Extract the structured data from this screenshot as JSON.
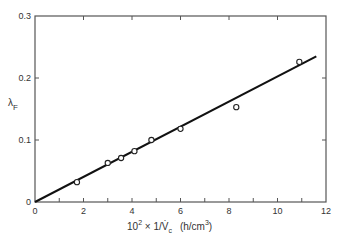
{
  "chart_data": {
    "type": "scatter",
    "title": "",
    "xlabel": "10² × 1/V̇c (h/cm³)",
    "xlabel_parts": {
      "main": "10",
      "sup": "2",
      "rest": " × 1/V̇",
      "sub": "c",
      "unit": "(h/cm",
      "unit_sup": "3",
      "unit_end": ")"
    },
    "ylabel": "λF",
    "ylabel_parts": {
      "main": "λ",
      "sub": "F"
    },
    "xlim": [
      0,
      12
    ],
    "ylim": [
      0,
      0.3
    ],
    "x_ticks": [
      0,
      2,
      4,
      6,
      8,
      10,
      12
    ],
    "x_tick_labels": [
      "0",
      "2",
      "4",
      "6",
      "8",
      "10",
      "12"
    ],
    "x_minor_ticks": [
      1,
      3,
      5,
      7,
      9,
      11
    ],
    "y_ticks": [
      0,
      0.1,
      0.2,
      0.3
    ],
    "y_tick_labels": [
      "0",
      "0.1",
      "0.2",
      "0.3"
    ],
    "top_ticks": [
      2,
      4,
      6,
      8,
      10
    ],
    "right_ticks": [
      0.1,
      0.2
    ],
    "grid": false,
    "legend": null,
    "series": [
      {
        "name": "measured",
        "marker": "open-circle",
        "x": [
          1.73,
          3.0,
          3.55,
          4.1,
          4.8,
          6.0,
          8.3,
          10.9
        ],
        "y": [
          0.032,
          0.063,
          0.071,
          0.082,
          0.1,
          0.118,
          0.153,
          0.226
        ]
      },
      {
        "name": "fit-line",
        "marker": "none",
        "line": "solid",
        "x": [
          0,
          11.6
        ],
        "y": [
          0,
          0.235
        ]
      }
    ]
  },
  "colors": {
    "axis": "#555555",
    "line": "#111111",
    "marker": "#222222",
    "background": "#ffffff"
  }
}
